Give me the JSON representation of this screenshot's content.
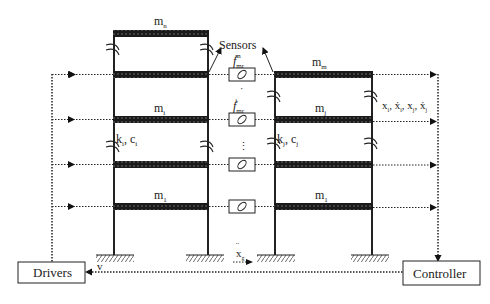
{
  "diagram": {
    "type": "structural-control-schematic",
    "left_building": {
      "top_mass_label": "m",
      "top_mass_sub": "n",
      "floor_mass_label": "m",
      "floor_mass_sub": "i",
      "ground_mass_label": "m",
      "ground_mass_sub": "1",
      "stiffness_label": "k",
      "stiffness_sub": "i",
      "damping_label": "c",
      "damping_sub": "i"
    },
    "right_building": {
      "top_mass_label": "m",
      "top_mass_sub": "m",
      "floor_mass_label": "m",
      "floor_mass_sub": "j",
      "ground_mass_label": "m",
      "ground_mass_sub": "1",
      "stiffness_label": "k",
      "stiffness_sub": "j",
      "damping_label": "c",
      "damping_sub": "j"
    },
    "sensors_label": "Sensors",
    "damper_force_top": {
      "base": "f",
      "sub": "mr",
      "sup": "m"
    },
    "damper_force_mid": {
      "base": "f",
      "sub": "mr",
      "sup": "i"
    },
    "ellipsis": "⋮",
    "state_label": "x",
    "state_sub_i": "i",
    "state_sub_j": "j",
    "ground_accel_label": "x",
    "ground_accel_sub": "g",
    "voltage_label": "v",
    "drivers_label": "Drivers",
    "controller_label": "Controller",
    "colors": {
      "line": "#222222",
      "slab": "#1a1a1a",
      "background": "#ffffff"
    }
  }
}
